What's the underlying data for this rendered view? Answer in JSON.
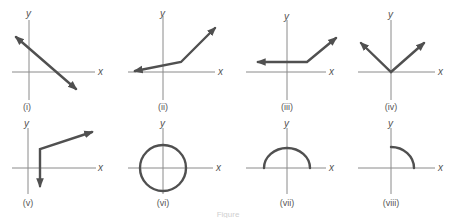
{
  "figure": {
    "caption": "Figure",
    "panels": [
      {
        "id": "i",
        "label": "(i)",
        "x_label": "x",
        "y_label": "y",
        "shape": "line with negative slope, arrows both ends"
      },
      {
        "id": "ii",
        "label": "(ii)",
        "x_label": "x",
        "y_label": "y",
        "shape": "piecewise linear, shallow then steep increase"
      },
      {
        "id": "iii",
        "label": "(iii)",
        "x_label": "x",
        "y_label": "y",
        "shape": "horizontal ray then increasing ray"
      },
      {
        "id": "iv",
        "label": "(iv)",
        "x_label": "x",
        "y_label": "y",
        "shape": "V shape at origin (absolute value)"
      },
      {
        "id": "v",
        "label": "(v)",
        "x_label": "x",
        "y_label": "y",
        "shape": "vertical ray down plus increasing ray"
      },
      {
        "id": "vi",
        "label": "(vi)",
        "x_label": "x",
        "y_label": "y",
        "shape": "full circle centered at origin"
      },
      {
        "id": "vii",
        "label": "(vii)",
        "x_label": "x",
        "y_label": "y",
        "shape": "upper semicircle"
      },
      {
        "id": "viii",
        "label": "(viii)",
        "x_label": "x",
        "y_label": "y",
        "shape": "quarter circle in first quadrant"
      }
    ]
  },
  "colors": {
    "axis": "#8a8a8a",
    "curve": "#505050",
    "text": "#555555"
  }
}
